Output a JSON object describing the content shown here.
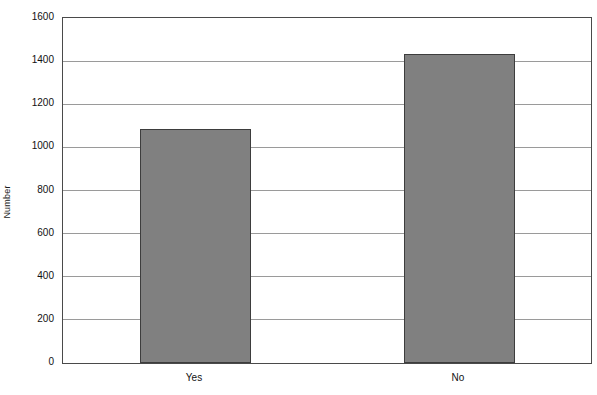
{
  "chart_data": {
    "type": "bar",
    "title": "",
    "subtitle": "",
    "xlabel": "",
    "ylabel": "Number",
    "categories": [
      "Yes",
      "No"
    ],
    "values": [
      1085,
      1432
    ],
    "ylim": [
      0,
      1600
    ],
    "y_ticks": [
      0,
      200,
      400,
      600,
      800,
      1000,
      1200,
      1400,
      1600
    ],
    "y_tick_labels": [
      "0",
      "200",
      "400",
      "600",
      "800",
      "1000",
      "1200",
      "1400",
      "1600"
    ],
    "grid": {
      "horizontal": true,
      "vertical": false,
      "color": "#9a9a9a"
    },
    "legend": {
      "visible": false,
      "position": "none",
      "entries": []
    },
    "annotations": [],
    "series": [
      {
        "name": "Number",
        "values": [
          1085,
          1432
        ],
        "color": "#808080",
        "edge_color": "#3d3d3d"
      }
    ],
    "colors": {
      "bar_fill": "#808080",
      "bar_edge": "#3d3d3d",
      "plot_border": "#4a4a4a",
      "gridline": "#9a9a9a",
      "background": "#ffffff",
      "text": "#111111"
    }
  }
}
